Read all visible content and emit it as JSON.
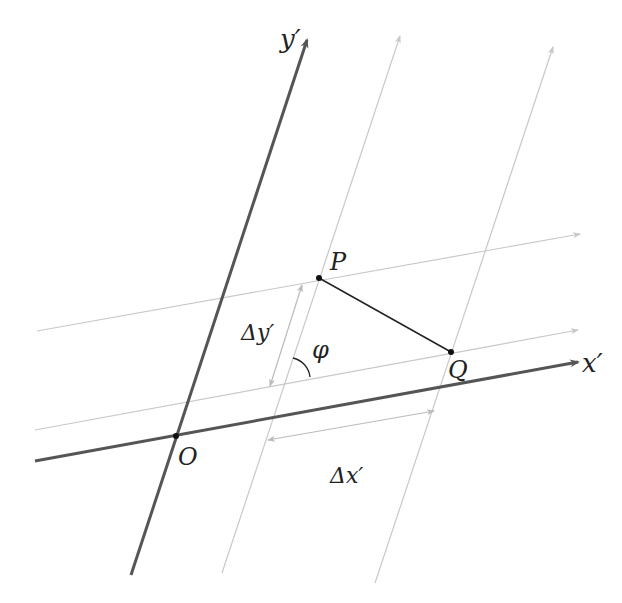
{
  "diagram": {
    "type": "oblique-coordinate-system",
    "colors": {
      "axis": "#555555",
      "grid": "#c8c8c8",
      "segment": "#222222",
      "label": "#222222",
      "point": "#111111"
    },
    "axes": {
      "x_label": "x′",
      "y_label": "y′"
    },
    "points": {
      "origin": "O",
      "p": "P",
      "q": "Q"
    },
    "measures": {
      "delta_x": "Δx′",
      "delta_y": "Δy′",
      "angle": "φ"
    }
  }
}
